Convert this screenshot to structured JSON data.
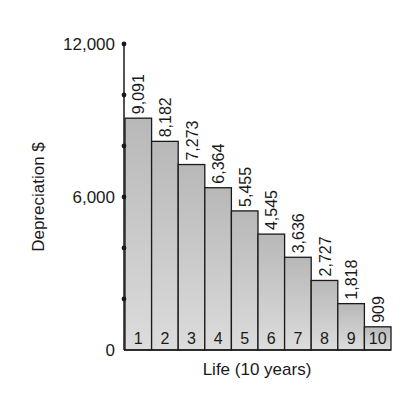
{
  "chart_data": {
    "type": "bar",
    "title": "",
    "xlabel": "Life (10 years)",
    "ylabel": "Depreciation $",
    "categories": [
      "1",
      "2",
      "3",
      "4",
      "5",
      "6",
      "7",
      "8",
      "9",
      "10"
    ],
    "values": [
      9091,
      8182,
      7273,
      6364,
      5455,
      4545,
      3636,
      2727,
      1818,
      909
    ],
    "value_labels": [
      "9,091",
      "8,182",
      "7,273",
      "6,364",
      "5,455",
      "4,545",
      "3,636",
      "2,727",
      "1,818",
      "909"
    ],
    "ylim": [
      0,
      12000
    ],
    "yticks": [
      0,
      6000,
      12000
    ],
    "ytick_labels": [
      "0",
      "6,000",
      "12,000"
    ],
    "minor_ticks": [
      2000,
      4000,
      8000,
      10000
    ],
    "grid": false,
    "legend": null,
    "bar_color": "#c4c4c4",
    "bar_edge_color": "#1a1a1a"
  }
}
